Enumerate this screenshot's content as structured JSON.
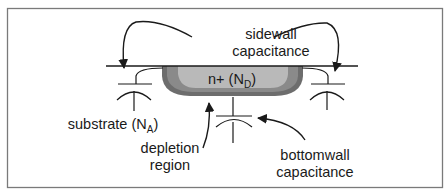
{
  "diagram": {
    "type": "cross-section",
    "colors": {
      "frame": "#7a7a7a",
      "line": "#1a1a1a",
      "n_plus_region": "#b9b9b9",
      "depletion_region_outer": "#6d6d6d",
      "depletion_region_inner": "#8a8a8a",
      "background": "#ffffff"
    },
    "labels": {
      "sidewall": {
        "line1": "sidewall",
        "line2": "capacitance"
      },
      "n_plus": {
        "main": "n+ (N",
        "subscript": "D",
        "close": ")"
      },
      "substrate": {
        "main": "substrate (N",
        "subscript": "A",
        "close": ")"
      },
      "depletion": {
        "line1": "depletion",
        "line2": "region"
      },
      "bottomwall": {
        "line1": "bottomwall",
        "line2": "capacitance"
      }
    },
    "elements": [
      {
        "name": "surface-line"
      },
      {
        "name": "n-plus-diffusion"
      },
      {
        "name": "depletion-region"
      },
      {
        "name": "left-sidewall-capacitor"
      },
      {
        "name": "right-sidewall-capacitor"
      },
      {
        "name": "bottomwall-capacitor"
      },
      {
        "name": "sidewall-arrow-left"
      },
      {
        "name": "sidewall-arrow-right"
      },
      {
        "name": "depletion-arrow"
      },
      {
        "name": "bottomwall-arrow"
      }
    ]
  }
}
